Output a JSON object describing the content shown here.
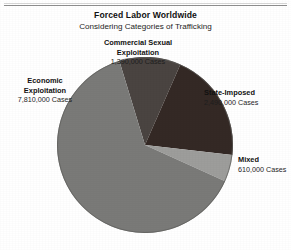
{
  "figure": {
    "title": "Forced Labor Worldwide",
    "subtitle": "Considering Categories of Trafficking"
  },
  "labels": {
    "commercial_sexual": {
      "line1": "Commercial Sexual",
      "line2": "Exploitation",
      "value": "1,390,000 Cases"
    },
    "economic": {
      "line1": "Economic",
      "line2": "Exploitation",
      "value": "7,810,000 Cases"
    },
    "state_imposed": {
      "line1": "State-Imposed",
      "line2": "",
      "value": "2,490,000 Cases"
    },
    "mixed": {
      "line1": "Mixed",
      "line2": "",
      "value": "610,000 Cases"
    }
  },
  "chart_data": {
    "type": "pie",
    "title": "Forced Labor Worldwide",
    "subtitle": "Considering Categories of Trafficking",
    "unit": "Cases",
    "total": 12300000,
    "legend": "none",
    "grid": false,
    "start_angle_deg": -17,
    "direction": "clockwise",
    "categories": [
      "Commercial Sexual Exploitation",
      "State-Imposed",
      "Mixed",
      "Economic Exploitation"
    ],
    "values": [
      1390000,
      2490000,
      610000,
      7810000
    ],
    "value_labels": [
      "1,390,000 Cases",
      "2,490,000 Cases",
      "610,000 Cases",
      "7,810,000 Cases"
    ],
    "percentages": [
      11.3,
      20.2,
      5.0,
      63.5
    ],
    "colors": [
      "#4a4441",
      "#342925",
      "#9d9d9b",
      "#7a7a78"
    ]
  },
  "colors": {
    "commercial_sexual": "#4a4441",
    "state_imposed": "#342925",
    "mixed": "#9d9d9b",
    "economic": "#7a7a78",
    "rule": "#8e8e8e",
    "background": "#ffffff",
    "text": "#111111"
  }
}
